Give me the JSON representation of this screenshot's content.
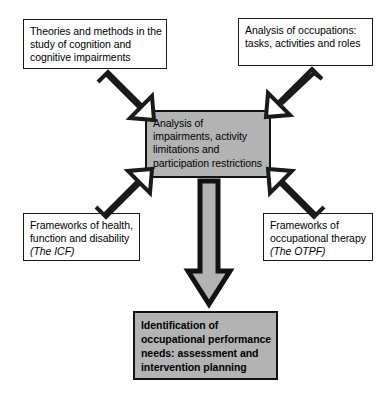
{
  "diagram": {
    "colors": {
      "shade_fill": "#b3b3b3",
      "box_stroke": "#1a1a1a",
      "page_background": "#ffffff",
      "arrow_outline_fill": "#ffffff",
      "arrow_filled_fill": "#b3b3b3"
    },
    "nodes": {
      "theories": {
        "id": "theories-box",
        "style": "plain",
        "lines": [
          "Theories and methods in the",
          "study of cognition and",
          "cognitive impairments"
        ]
      },
      "occupations": {
        "id": "occupations-box",
        "style": "plain",
        "lines": [
          "Analysis of occupations:",
          "tasks, activities and roles"
        ]
      },
      "center": {
        "id": "center-analysis-box",
        "style": "shaded",
        "lines": [
          "Analysis of",
          "impairments, activity",
          "limitations and",
          "participation restrictions"
        ]
      },
      "icf": {
        "id": "icf-box",
        "style": "plain",
        "lines": [
          "Frameworks of health,",
          "function and disability"
        ],
        "italic_line": "(The ICF)"
      },
      "otpf": {
        "id": "otpf-box",
        "style": "plain",
        "lines": [
          "Frameworks of",
          "occupational therapy"
        ],
        "italic_line": "(The OTPF)"
      },
      "outcome": {
        "id": "outcome-box",
        "style": "shaded-bold",
        "lines": [
          "Identification of",
          "occupational performance",
          "needs: assessment and",
          "intervention planning"
        ]
      }
    },
    "arrows": [
      {
        "name": "arrow-theories-to-center",
        "from": "theories",
        "to": "center",
        "direction": "down-right",
        "fill": "white"
      },
      {
        "name": "arrow-occupations-to-center",
        "from": "occupations",
        "to": "center",
        "direction": "down-left",
        "fill": "white"
      },
      {
        "name": "arrow-icf-to-center",
        "from": "icf",
        "to": "center",
        "direction": "up-right",
        "fill": "white"
      },
      {
        "name": "arrow-otpf-to-center",
        "from": "otpf",
        "to": "center",
        "direction": "up-left",
        "fill": "white"
      },
      {
        "name": "arrow-center-to-outcome",
        "from": "center",
        "to": "outcome",
        "direction": "down",
        "fill": "gray"
      }
    ]
  }
}
